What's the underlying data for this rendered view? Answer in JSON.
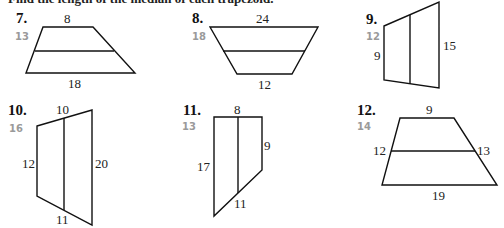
{
  "header": {
    "instruction": "Find the length of the median of each trapezoid."
  },
  "problems": [
    {
      "number": "7.",
      "answer": "13",
      "labels": [
        "8",
        "18"
      ]
    },
    {
      "number": "8.",
      "answer": "18",
      "labels": [
        "24",
        "12"
      ]
    },
    {
      "number": "9.",
      "answer": "12",
      "labels": [
        "9",
        "15"
      ]
    },
    {
      "number": "10.",
      "answer": "16",
      "labels": [
        "10",
        "12",
        "20",
        "11"
      ]
    },
    {
      "number": "11.",
      "answer": "13",
      "labels": [
        "8",
        "17",
        "9",
        "11"
      ]
    },
    {
      "number": "12.",
      "answer": "14",
      "labels": [
        "9",
        "12",
        "13",
        "19"
      ]
    }
  ]
}
